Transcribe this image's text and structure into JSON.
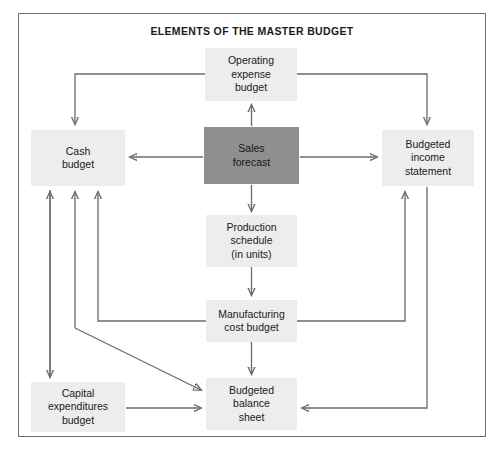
{
  "diagram": {
    "title": "ELEMENTS OF THE MASTER BUDGET",
    "border_color": "#6e6e6e",
    "node_fill": "#ededed",
    "highlight_fill": "#8f8f8f",
    "connector_color": "#6b6b6b",
    "nodes": [
      {
        "id": "operating-expense-budget",
        "label": "Operating\nexpense\nbudget",
        "x": 205,
        "y": 48,
        "w": 92,
        "h": 53,
        "highlight": false
      },
      {
        "id": "cash-budget",
        "label": "Cash\nbudget",
        "x": 31,
        "y": 130,
        "w": 94,
        "h": 56,
        "highlight": false
      },
      {
        "id": "sales-forecast",
        "label": "Sales\nforecast",
        "x": 204,
        "y": 127,
        "w": 95,
        "h": 57,
        "highlight": true
      },
      {
        "id": "budgeted-income-statement",
        "label": "Budgeted\nincome\nstatement",
        "x": 382,
        "y": 130,
        "w": 92,
        "h": 56,
        "highlight": false
      },
      {
        "id": "production-schedule",
        "label": "Production\nschedule\n(in units)",
        "x": 206,
        "y": 215,
        "w": 91,
        "h": 52,
        "highlight": false
      },
      {
        "id": "manufacturing-cost-budget",
        "label": "Manufacturing\ncost budget",
        "x": 206,
        "y": 300,
        "w": 91,
        "h": 42,
        "highlight": false
      },
      {
        "id": "capital-expenditures-budget",
        "label": "Capital\nexpenditures\nbudget",
        "x": 31,
        "y": 382,
        "w": 94,
        "h": 50,
        "highlight": false
      },
      {
        "id": "budgeted-balance-sheet",
        "label": "Budgeted\nbalance\nsheet",
        "x": 206,
        "y": 378,
        "w": 91,
        "h": 52,
        "highlight": false
      }
    ],
    "connections": [
      {
        "id": "sales-to-operating-expense",
        "from": "sales-forecast",
        "to": "operating-expense-budget"
      },
      {
        "id": "sales-to-cash-budget",
        "from": "sales-forecast",
        "to": "cash-budget"
      },
      {
        "id": "sales-to-budgeted-income-statement",
        "from": "sales-forecast",
        "to": "budgeted-income-statement"
      },
      {
        "id": "sales-to-production-schedule",
        "from": "sales-forecast",
        "to": "production-schedule"
      },
      {
        "id": "operating-expense-to-cash-budget",
        "from": "operating-expense-budget",
        "to": "cash-budget"
      },
      {
        "id": "operating-expense-to-budgeted-income-statement",
        "from": "operating-expense-budget",
        "to": "budgeted-income-statement"
      },
      {
        "id": "production-schedule-to-manufacturing-cost-budget",
        "from": "production-schedule",
        "to": "manufacturing-cost-budget"
      },
      {
        "id": "manufacturing-cost-to-cash-budget",
        "from": "manufacturing-cost-budget",
        "to": "cash-budget"
      },
      {
        "id": "manufacturing-cost-to-budgeted-income-statement",
        "from": "manufacturing-cost-budget",
        "to": "budgeted-income-statement"
      },
      {
        "id": "manufacturing-cost-to-budgeted-balance-sheet",
        "from": "manufacturing-cost-budget",
        "to": "budgeted-balance-sheet"
      },
      {
        "id": "manufacturing-cost-to-budgeted-balance-sheet-direct",
        "from": "manufacturing-cost-budget",
        "to": "budgeted-balance-sheet"
      },
      {
        "id": "capital-expenditures-to-cash-budget",
        "from": "capital-expenditures-budget",
        "to": "cash-budget"
      },
      {
        "id": "cash-budget-to-capital-expenditures",
        "from": "cash-budget",
        "to": "capital-expenditures-budget"
      },
      {
        "id": "capital-expenditures-to-budgeted-balance-sheet",
        "from": "capital-expenditures-budget",
        "to": "budgeted-balance-sheet"
      },
      {
        "id": "budgeted-income-statement-to-budgeted-balance-sheet",
        "from": "budgeted-income-statement",
        "to": "budgeted-balance-sheet"
      }
    ]
  }
}
